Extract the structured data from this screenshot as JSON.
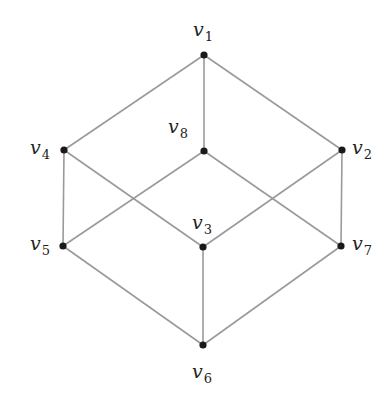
{
  "diagram": {
    "type": "graph",
    "nodes": [
      {
        "id": "v1",
        "name": "v",
        "sub": "1",
        "x": 204,
        "y": 55,
        "label_x": 193,
        "label_y": 20
      },
      {
        "id": "v2",
        "name": "v",
        "sub": "2",
        "x": 342,
        "y": 150,
        "label_x": 352,
        "label_y": 138
      },
      {
        "id": "v3",
        "name": "v",
        "sub": "3",
        "x": 203,
        "y": 247,
        "label_x": 192,
        "label_y": 213
      },
      {
        "id": "v4",
        "name": "v",
        "sub": "4",
        "x": 64,
        "y": 150,
        "label_x": 30,
        "label_y": 138
      },
      {
        "id": "v5",
        "name": "v",
        "sub": "5",
        "x": 63,
        "y": 246,
        "label_x": 30,
        "label_y": 234
      },
      {
        "id": "v6",
        "name": "v",
        "sub": "6",
        "x": 203,
        "y": 345,
        "label_x": 192,
        "label_y": 362
      },
      {
        "id": "v7",
        "name": "v",
        "sub": "7",
        "x": 341,
        "y": 246,
        "label_x": 352,
        "label_y": 234
      },
      {
        "id": "v8",
        "name": "v",
        "sub": "8",
        "x": 204,
        "y": 151,
        "label_x": 168,
        "label_y": 117
      }
    ],
    "edges": [
      [
        "v1",
        "v4"
      ],
      [
        "v1",
        "v2"
      ],
      [
        "v1",
        "v8"
      ],
      [
        "v4",
        "v5"
      ],
      [
        "v4",
        "v3"
      ],
      [
        "v2",
        "v7"
      ],
      [
        "v2",
        "v3"
      ],
      [
        "v8",
        "v5"
      ],
      [
        "v8",
        "v7"
      ],
      [
        "v5",
        "v6"
      ],
      [
        "v7",
        "v6"
      ],
      [
        "v3",
        "v6"
      ]
    ],
    "colors": {
      "edge": "#9a9a9a",
      "node": "#1a1a1a",
      "label": "#222222"
    }
  }
}
